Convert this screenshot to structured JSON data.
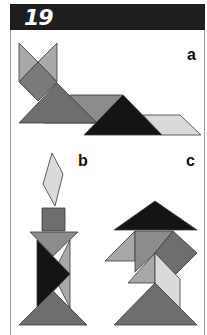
{
  "header": {
    "number": "19"
  },
  "figures": [
    {
      "label": "a",
      "description": "tangram cat lying down"
    },
    {
      "label": "b",
      "description": "tangram candle with flame"
    },
    {
      "label": "c",
      "description": "tangram figure c"
    }
  ],
  "colors": {
    "header_bg": "#1e1e1e",
    "black": "#141414",
    "dark_grey": "#6e6e6e",
    "mid_grey": "#8c8c8c",
    "light_grey": "#a8a8a8",
    "pale_grey": "#dadada",
    "outline": "#3a3a3a"
  }
}
